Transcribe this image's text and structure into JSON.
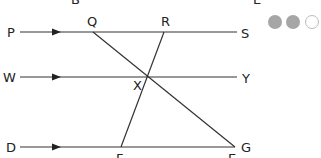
{
  "diagram": {
    "colors": {
      "line": "#333333",
      "text": "#222222",
      "dot_filled": "#a6a6a6",
      "dot_outline": "#bbbbbb"
    },
    "labels": {
      "top_left_cut": "B",
      "top_right_cut": "E",
      "P": "P",
      "Q": "Q",
      "R": "R",
      "S": "S",
      "W": "W",
      "X": "X",
      "Y": "Y",
      "D": "D",
      "F": "F",
      "E": "E",
      "G": "G"
    },
    "parallel_lines": [
      {
        "name": "PS",
        "from": "P",
        "to": "S",
        "y": 32
      },
      {
        "name": "WY",
        "from": "W",
        "to": "Y",
        "y": 77
      },
      {
        "name": "DG",
        "from": "D",
        "to": "G",
        "y": 147
      }
    ],
    "transversals": [
      {
        "name": "QE",
        "from": "Q",
        "to": "E"
      },
      {
        "name": "RF",
        "from": "R",
        "to": "F"
      }
    ],
    "intersection": "X",
    "progress_dots": {
      "filled": 2,
      "empty": 1
    }
  }
}
